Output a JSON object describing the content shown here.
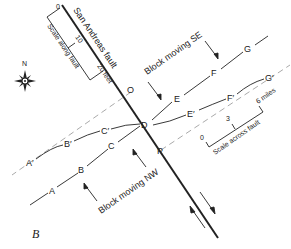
{
  "figure": {
    "panel_label": "B",
    "fault_label": "San Andreas fault",
    "north_label": "N",
    "blocks": {
      "se_label": "Block moving SE",
      "nw_label": "Block moving NW"
    },
    "points": {
      "A": "A",
      "B": "B",
      "C": "C",
      "D": "D",
      "E": "E",
      "F": "F",
      "G": "G",
      "A_prime": "A′",
      "B_prime": "B′",
      "C_prime": "C′",
      "E_prime": "E′",
      "F_prime": "F′",
      "G_prime": "G′",
      "O": "O",
      "P": "P"
    },
    "scale_along_fault": {
      "label": "Scale along fault",
      "tick_0": "0",
      "tick_10": "10",
      "tick_20": "20 feet"
    },
    "scale_across_fault": {
      "label": "Scale across fault",
      "tick_0": "0",
      "tick_3": "3",
      "tick_6": "6 miles"
    },
    "colors": {
      "line": "#222222",
      "dashed": "#aaaaaa"
    }
  }
}
